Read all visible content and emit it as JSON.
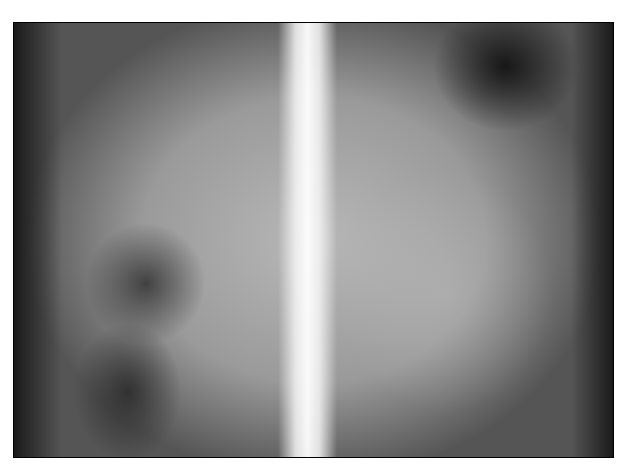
{
  "image": {
    "description": "Radiograph (X-ray) of the abdomen/thorax with a bright vertical spine in the center, framed with a black border on a white background",
    "text": []
  }
}
